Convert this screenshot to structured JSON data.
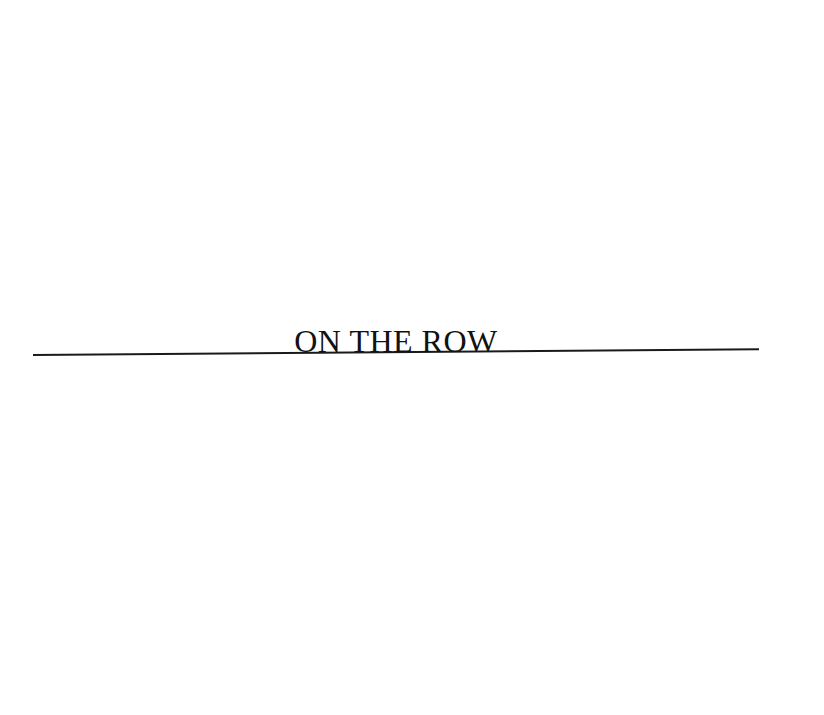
{
  "logo": {
    "wordmark": "ON THE ROW",
    "text_color": "#111111",
    "rule_color": "#1a1a1a"
  },
  "page": {
    "background": "#ffffff"
  }
}
